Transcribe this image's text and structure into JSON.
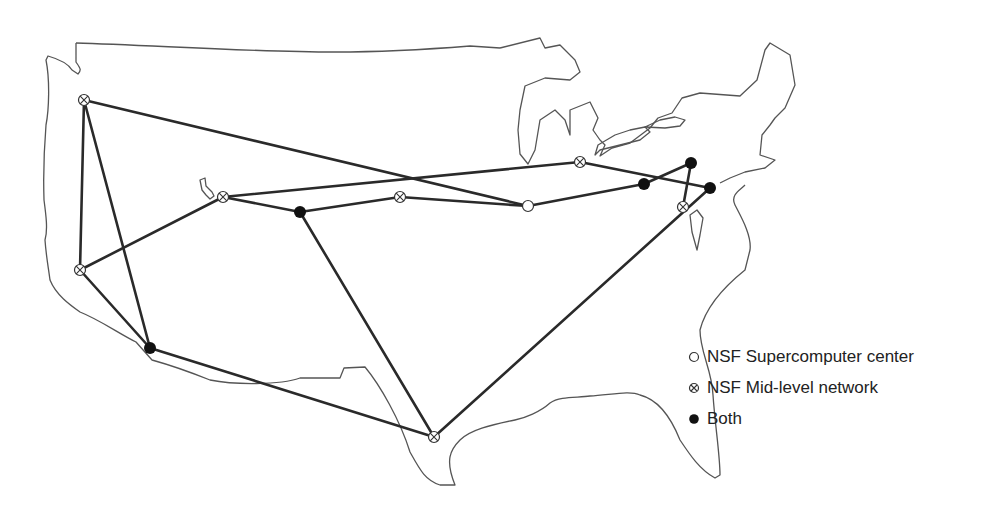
{
  "diagram": {
    "colors": {
      "link": "#2a2a2a",
      "outline": "#555555",
      "node_fill_both": "#111111",
      "background": "#ffffff"
    },
    "nodes": [
      {
        "id": "n1",
        "type": "midlevel",
        "x": 84,
        "y": 100
      },
      {
        "id": "n2",
        "type": "midlevel",
        "x": 223,
        "y": 197
      },
      {
        "id": "n3",
        "type": "midlevel",
        "x": 80,
        "y": 270
      },
      {
        "id": "n4",
        "type": "both",
        "x": 150,
        "y": 348
      },
      {
        "id": "n5",
        "type": "both",
        "x": 300,
        "y": 212
      },
      {
        "id": "n6",
        "type": "midlevel",
        "x": 400,
        "y": 197
      },
      {
        "id": "n7",
        "type": "supercomputer",
        "x": 528,
        "y": 206
      },
      {
        "id": "n8",
        "type": "midlevel",
        "x": 580,
        "y": 162
      },
      {
        "id": "n9",
        "type": "both",
        "x": 644,
        "y": 184
      },
      {
        "id": "n10",
        "type": "both",
        "x": 691,
        "y": 163
      },
      {
        "id": "n11",
        "type": "both",
        "x": 710,
        "y": 188
      },
      {
        "id": "n12",
        "type": "midlevel",
        "x": 683,
        "y": 207
      },
      {
        "id": "n13",
        "type": "midlevel",
        "x": 434,
        "y": 437
      }
    ],
    "links": [
      [
        "n1",
        "n3"
      ],
      [
        "n1",
        "n4"
      ],
      [
        "n1",
        "n7"
      ],
      [
        "n3",
        "n2"
      ],
      [
        "n3",
        "n4"
      ],
      [
        "n2",
        "n8"
      ],
      [
        "n2",
        "n5"
      ],
      [
        "n5",
        "n6"
      ],
      [
        "n5",
        "n13"
      ],
      [
        "n6",
        "n7"
      ],
      [
        "n7",
        "n9"
      ],
      [
        "n8",
        "n11"
      ],
      [
        "n9",
        "n10"
      ],
      [
        "n10",
        "n12"
      ],
      [
        "n4",
        "n13"
      ],
      [
        "n13",
        "n11"
      ]
    ]
  },
  "legend": {
    "items": [
      {
        "symbol": "open-circle",
        "label": "NSF Supercomputer center"
      },
      {
        "symbol": "circle-x",
        "label": "NSF Mid-level network"
      },
      {
        "symbol": "filled-circle",
        "label": "Both"
      }
    ]
  }
}
